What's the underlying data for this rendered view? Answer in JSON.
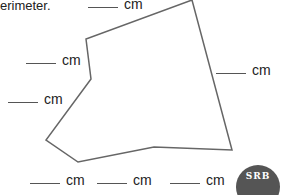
{
  "instruction": {
    "text": "erimeter."
  },
  "unit": "cm",
  "labels": [
    {
      "id": "top-edge",
      "text": "cm"
    },
    {
      "id": "upper-left-edge",
      "text": "cm"
    },
    {
      "id": "right-edge",
      "text": "cm"
    },
    {
      "id": "lower-left-edge",
      "text": "cm"
    },
    {
      "id": "bottom-1",
      "text": "cm"
    },
    {
      "id": "bottom-2",
      "text": "cm"
    },
    {
      "id": "bottom-3",
      "text": "cm"
    }
  ],
  "polygon": {
    "points": "192,0 86,39 91,79 46,140 78,162 154,147 232,150",
    "stroke": "#666666"
  },
  "logo": {
    "text": "SRB"
  }
}
